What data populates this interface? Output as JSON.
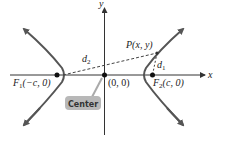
{
  "diagram": {
    "axes": {
      "x_label": "x",
      "y_label": "y"
    },
    "points": {
      "f1": {
        "name": "F",
        "sub": "1",
        "coords": "(−c, 0)"
      },
      "f2": {
        "name": "F",
        "sub": "2",
        "coords": "(c, 0)"
      },
      "center": {
        "coords": "(0, 0)"
      },
      "p": {
        "label": "P(x, y)"
      }
    },
    "distances": {
      "d1": {
        "name": "d",
        "sub": "1"
      },
      "d2": {
        "name": "d",
        "sub": "2"
      }
    },
    "callout": {
      "label": "Center"
    },
    "colors": {
      "curve": "#555555",
      "axis": "#333333",
      "callout_fill": "#b8b8b8",
      "callout_text": "#333333"
    }
  }
}
